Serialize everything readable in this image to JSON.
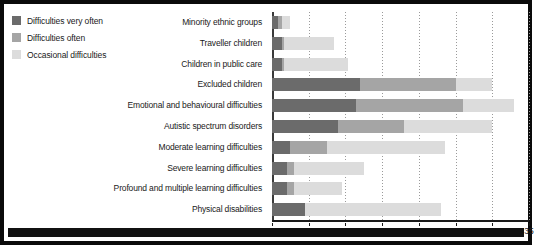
{
  "legend": {
    "items": [
      {
        "label": "Difficulties very often",
        "color": "#6b6b6b",
        "icon": "legend-swatch"
      },
      {
        "label": "Difficulties often",
        "color": "#a5a5a5",
        "icon": "legend-swatch"
      },
      {
        "label": "Occasional difficulties",
        "color": "#dcdcdc",
        "icon": "legend-swatch"
      }
    ]
  },
  "chart_data": {
    "type": "bar",
    "orientation": "horizontal",
    "stacked": true,
    "title": "",
    "xlabel": "",
    "ylabel": "",
    "xlim": [
      0,
      35
    ],
    "xticks": [
      0,
      5,
      10,
      15,
      20,
      25,
      30,
      35
    ],
    "xtick_labels": [
      "0",
      "5",
      "10",
      "15",
      "20",
      "25",
      "30",
      "35"
    ],
    "grid": true,
    "grid_axis": "x",
    "grid_style": "dotted",
    "legend_position": "top-left-outside",
    "categories": [
      "Minority ethnic groups",
      "Traveller children",
      "Children in public care",
      "Excluded children",
      "Emotional and behavioural difficulties",
      "Autistic spectrum disorders",
      "Moderate learning difficulties",
      "Severe learning difficulties",
      "Profound and multiple learning difficulties",
      "Physical disabilities"
    ],
    "series": [
      {
        "name": "Difficulties very often",
        "color": "#6b6b6b",
        "values": [
          0.8,
          1.3,
          1.3,
          12.0,
          11.5,
          9.0,
          2.5,
          2.0,
          2.0,
          4.5
        ]
      },
      {
        "name": "Difficulties often",
        "color": "#a5a5a5",
        "values": [
          0.6,
          0.4,
          0.4,
          13.0,
          14.5,
          9.0,
          5.0,
          1.0,
          1.0,
          0.0
        ]
      },
      {
        "name": "Occasional difficulties",
        "color": "#dcdcdc",
        "values": [
          1.1,
          6.8,
          8.6,
          5.0,
          7.0,
          12.0,
          16.0,
          9.5,
          6.5,
          18.5
        ]
      }
    ],
    "totals": [
      2.5,
      8.5,
      10.3,
      30.0,
      33.0,
      30.0,
      23.5,
      12.5,
      9.5,
      23.0
    ]
  }
}
